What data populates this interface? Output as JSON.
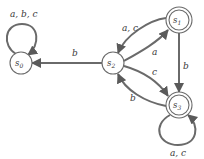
{
  "diagram": {
    "type": "finite-state-automaton",
    "states": [
      {
        "id": "s0",
        "name": "s",
        "sub": "0",
        "accepting": false
      },
      {
        "id": "s1",
        "name": "s",
        "sub": "1",
        "accepting": true
      },
      {
        "id": "s2",
        "name": "s",
        "sub": "2",
        "accepting": false
      },
      {
        "id": "s3",
        "name": "s",
        "sub": "3",
        "accepting": true
      }
    ],
    "transitions": [
      {
        "from": "s0",
        "to": "s0",
        "label": "a, b, c"
      },
      {
        "from": "s2",
        "to": "s0",
        "label": "b"
      },
      {
        "from": "s2",
        "to": "s1",
        "label": "a, c"
      },
      {
        "from": "s1",
        "to": "s2",
        "label": "a"
      },
      {
        "from": "s2",
        "to": "s3",
        "label": "c"
      },
      {
        "from": "s3",
        "to": "s2",
        "label": "b"
      },
      {
        "from": "s1",
        "to": "s3",
        "label": "b"
      },
      {
        "from": "s3",
        "to": "s3",
        "label": "a, c"
      }
    ]
  }
}
